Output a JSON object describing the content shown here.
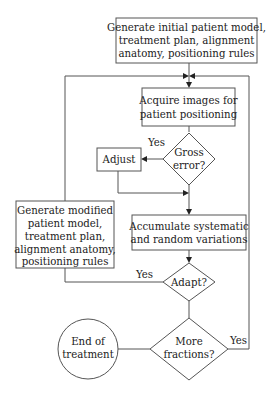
{
  "diagram": {
    "type": "flowchart",
    "nodes": {
      "generate_initial": {
        "shape": "rect",
        "lines": [
          "Generate initial patient model,",
          "treatment plan, alignment",
          "anatomy, positioning rules"
        ]
      },
      "acquire_images": {
        "shape": "rect",
        "lines": [
          "Acquire images for",
          "patient positioning"
        ]
      },
      "gross_error": {
        "shape": "diamond",
        "lines": [
          "Gross",
          "error?"
        ]
      },
      "adjust": {
        "shape": "rect",
        "lines": [
          "Adjust"
        ]
      },
      "generate_modified": {
        "shape": "rect",
        "lines": [
          "Generate modified",
          "patient model,",
          "treatment plan,",
          "alignment anatomy,",
          "positioning rules"
        ]
      },
      "accumulate": {
        "shape": "rect",
        "lines": [
          "Accumulate systematic",
          "and random variations"
        ]
      },
      "adapt": {
        "shape": "diamond",
        "lines": [
          "Adapt?"
        ]
      },
      "more_fractions": {
        "shape": "diamond",
        "lines": [
          "More",
          "fractions?"
        ]
      },
      "end_of_treatment": {
        "shape": "circle",
        "lines": [
          "End of",
          "treatment"
        ]
      }
    },
    "edges": [
      {
        "from": "generate_initial",
        "to": "acquire_images",
        "label": ""
      },
      {
        "from": "acquire_images",
        "to": "gross_error",
        "label": ""
      },
      {
        "from": "gross_error",
        "to": "adjust",
        "label": "Yes"
      },
      {
        "from": "adjust",
        "to": "accumulate",
        "label": ""
      },
      {
        "from": "gross_error",
        "to": "accumulate",
        "label": ""
      },
      {
        "from": "accumulate",
        "to": "adapt",
        "label": ""
      },
      {
        "from": "adapt",
        "to": "generate_modified",
        "label": "Yes"
      },
      {
        "from": "generate_modified",
        "to": "acquire_images",
        "label": ""
      },
      {
        "from": "adapt",
        "to": "more_fractions",
        "label": ""
      },
      {
        "from": "more_fractions",
        "to": "acquire_images",
        "label": "Yes"
      },
      {
        "from": "more_fractions",
        "to": "end_of_treatment",
        "label": ""
      }
    ],
    "edge_labels": {
      "gross_error_yes": "Yes",
      "adapt_yes": "Yes",
      "more_fractions_yes": "Yes"
    }
  }
}
